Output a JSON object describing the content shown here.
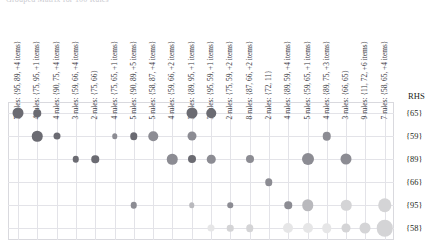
{
  "title": {
    "text": "Grouped Matrix for 100 Rules"
  },
  "axes": {
    "rhs_header": "RHS",
    "row_labels": [
      "{65}",
      "{59}",
      "{89}",
      "{66}",
      "{95}",
      "{58}"
    ],
    "col_labels": [
      "7 rules: {95, 89, +4 items}",
      "4 rules: {75, 95, +1 items}",
      "4 rules: {90, 75, +4 items}",
      "3 rules: {59, 66, +4 items}",
      "2 rules: {75, 66}",
      "4 rules: {75, 65, +1 items}",
      "5 rules: {90, 89, +5 items}",
      "5 rules: {58, 87, +4 items}",
      "4 rules: {59, 66, +2 items}",
      "3 rules: {89, 95, +1 items}",
      "3 rules: {95, 59, +1 items}",
      "2 rules: {75, 59, +2 items}",
      "8 rules: {87, 66, +2 items}",
      "2 rules: {72, 11}",
      "4 rules: {89, 59, +4 items}",
      "5 rules: {59, 65, +1 items}",
      "4 rules: {89, 75, +3 items}",
      "3 rules: {66, 65}",
      "9 rules: {11, 72, +6 items}",
      "7 rules: {58, 65, +4 items}"
    ]
  },
  "palette": {
    "dark": "#6b6b72",
    "mid": "#8c8c93",
    "light": "#b9b9bd",
    "pale": "#d4d4d6",
    "faint": "#e6e6e7",
    "grid": "#e3e3e8",
    "frame": "#d9d9de",
    "text": "#231f20"
  },
  "chart_data": {
    "type": "scatter",
    "subtype": "balloon-matrix",
    "title": "Grouped Matrix for 100 Rules",
    "xlabel": "LHS (antecedent rule groups)",
    "ylabel": "RHS (consequent)",
    "grid": true,
    "legend": "none",
    "x": [
      "7 rules: {95, 89, +4 items}",
      "4 rules: {75, 95, +1 items}",
      "4 rules: {90, 75, +4 items}",
      "3 rules: {59, 66, +4 items}",
      "2 rules: {75, 66}",
      "4 rules: {75, 65, +1 items}",
      "5 rules: {90, 89, +5 items}",
      "5 rules: {58, 87, +4 items}",
      "4 rules: {59, 66, +2 items}",
      "3 rules: {89, 95, +1 items}",
      "3 rules: {95, 59, +1 items}",
      "2 rules: {75, 59, +2 items}",
      "8 rules: {87, 66, +2 items}",
      "2 rules: {72, 11}",
      "4 rules: {89, 59, +4 items}",
      "5 rules: {59, 65, +1 items}",
      "4 rules: {89, 75, +3 items}",
      "3 rules: {66, 65}",
      "9 rules: {11, 72, +6 items}",
      "7 rules: {58, 65, +4 items}"
    ],
    "y": [
      "{65}",
      "{59}",
      "{89}",
      "{66}",
      "{95}",
      "{58}"
    ],
    "points": [
      {
        "col": 0,
        "row": 0,
        "size": 11.0,
        "shade": "dark"
      },
      {
        "col": 1,
        "row": 0,
        "size": 7.5,
        "shade": "dark"
      },
      {
        "col": 9,
        "row": 0,
        "size": 11.0,
        "shade": "dark"
      },
      {
        "col": 10,
        "row": 0,
        "size": 9.5,
        "shade": "dark"
      },
      {
        "col": 1,
        "row": 1,
        "size": 10.5,
        "shade": "dark"
      },
      {
        "col": 2,
        "row": 1,
        "size": 7.0,
        "shade": "dark"
      },
      {
        "col": 5,
        "row": 1,
        "size": 5.5,
        "shade": "mid"
      },
      {
        "col": 6,
        "row": 1,
        "size": 7.5,
        "shade": "dark"
      },
      {
        "col": 7,
        "row": 1,
        "size": 9.5,
        "shade": "mid"
      },
      {
        "col": 9,
        "row": 1,
        "size": 9.0,
        "shade": "mid"
      },
      {
        "col": 16,
        "row": 1,
        "size": 8.5,
        "shade": "mid"
      },
      {
        "col": 3,
        "row": 2,
        "size": 6.5,
        "shade": "dark"
      },
      {
        "col": 4,
        "row": 2,
        "size": 7.5,
        "shade": "dark"
      },
      {
        "col": 8,
        "row": 2,
        "size": 10.5,
        "shade": "mid"
      },
      {
        "col": 9,
        "row": 2,
        "size": 8.0,
        "shade": "dark"
      },
      {
        "col": 10,
        "row": 2,
        "size": 8.5,
        "shade": "mid"
      },
      {
        "col": 12,
        "row": 2,
        "size": 8.0,
        "shade": "mid"
      },
      {
        "col": 15,
        "row": 2,
        "size": 12.0,
        "shade": "mid"
      },
      {
        "col": 17,
        "row": 2,
        "size": 11.0,
        "shade": "mid"
      },
      {
        "col": 13,
        "row": 3,
        "size": 7.5,
        "shade": "mid"
      },
      {
        "col": 6,
        "row": 4,
        "size": 6.5,
        "shade": "mid"
      },
      {
        "col": 9,
        "row": 4,
        "size": 5.5,
        "shade": "light"
      },
      {
        "col": 11,
        "row": 4,
        "size": 5.5,
        "shade": "mid"
      },
      {
        "col": 14,
        "row": 4,
        "size": 7.5,
        "shade": "mid"
      },
      {
        "col": 15,
        "row": 4,
        "size": 11.5,
        "shade": "light"
      },
      {
        "col": 17,
        "row": 4,
        "size": 10.5,
        "shade": "pale"
      },
      {
        "col": 19,
        "row": 4,
        "size": 13.5,
        "shade": "pale"
      },
      {
        "col": 10,
        "row": 5,
        "size": 7.0,
        "shade": "faint"
      },
      {
        "col": 11,
        "row": 5,
        "size": 6.5,
        "shade": "pale"
      },
      {
        "col": 12,
        "row": 5,
        "size": 7.5,
        "shade": "pale"
      },
      {
        "col": 14,
        "row": 5,
        "size": 10.0,
        "shade": "faint"
      },
      {
        "col": 15,
        "row": 5,
        "size": 10.0,
        "shade": "faint"
      },
      {
        "col": 16,
        "row": 5,
        "size": 9.5,
        "shade": "faint"
      },
      {
        "col": 17,
        "row": 5,
        "size": 9.0,
        "shade": "pale"
      },
      {
        "col": 18,
        "row": 5,
        "size": 11.0,
        "shade": "pale"
      },
      {
        "col": 19,
        "row": 5,
        "size": 16.5,
        "shade": "pale"
      }
    ]
  },
  "geometry": {
    "plot_left": 18,
    "plot_top": 113,
    "col_step": 19.3,
    "row_step": 23.0,
    "label_baseline_y": 112,
    "rhs_label_x": 406
  }
}
